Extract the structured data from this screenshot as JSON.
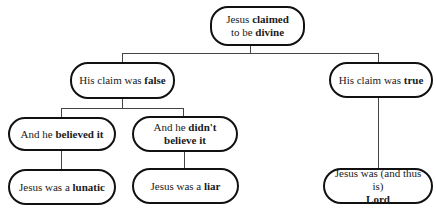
{
  "diagram": {
    "root": {
      "pre": "Jesus ",
      "bold": "claimed",
      "br": true,
      "pre2": "to be ",
      "bold2": "divine"
    },
    "false_node": {
      "pre": "His claim was ",
      "bold": "false"
    },
    "true_node": {
      "pre": "His claim was ",
      "bold": "true"
    },
    "believed_node": {
      "pre": "And he ",
      "bold": "believed it"
    },
    "didnt_node": {
      "pre": "And he ",
      "bold": "didn't believe it"
    },
    "lunatic_node": {
      "pre": "Jesus was a ",
      "bold": "lunatic"
    },
    "liar_node": {
      "pre": "Jesus was a ",
      "bold": "liar"
    },
    "lord_node": {
      "pre": "Jesus was (and thus is)",
      "bold": "Lord"
    }
  }
}
